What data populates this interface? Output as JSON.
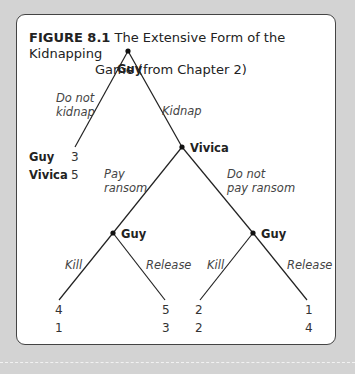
{
  "figure": {
    "label": "FIGURE 8.1",
    "title_line1": "The Extensive Form of the Kidnapping",
    "title_line2": "Game (from Chapter 2)"
  },
  "tree": {
    "root": {
      "player": "Guy"
    },
    "moves": {
      "do_not_kidnap_1": "Do not",
      "do_not_kidnap_2": "kidnap",
      "kidnap": "Kidnap",
      "pay_ransom_1": "Pay",
      "pay_ransom_2": "ransom",
      "do_not_pay_1": "Do not",
      "do_not_pay_2": "pay ransom",
      "kill_left": "Kill",
      "release_left": "Release",
      "kill_right": "Kill",
      "release_right": "Release"
    },
    "vivica_node": {
      "player": "Vivica"
    },
    "guy_left_node": {
      "player": "Guy"
    },
    "guy_right_node": {
      "player": "Guy"
    },
    "payoff_labels": {
      "row1": "Guy",
      "row2": "Vivica"
    },
    "payoffs": {
      "no_kidnap": {
        "guy": "3",
        "vivica": "5"
      },
      "pay_kill": {
        "guy": "4",
        "vivica": "1"
      },
      "pay_release": {
        "guy": "5",
        "vivica": "3"
      },
      "nopay_kill": {
        "guy": "2",
        "vivica": "2"
      },
      "nopay_release": {
        "guy": "1",
        "vivica": "4"
      }
    }
  }
}
